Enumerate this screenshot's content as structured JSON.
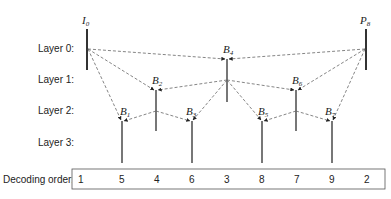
{
  "layers": [
    {
      "label": "Layer 0:",
      "y": 49
    },
    {
      "label": "Layer 1:",
      "y": 80
    },
    {
      "label": "Layer 2:",
      "y": 111
    },
    {
      "label": "Layer 3:",
      "y": 143
    }
  ],
  "frames": [
    {
      "id": "I0",
      "base": "I",
      "sub": "0",
      "x": 87,
      "layer": 0,
      "type": "reference"
    },
    {
      "id": "B1",
      "base": "B",
      "sub": "1",
      "x": 122,
      "layer": 2
    },
    {
      "id": "B2",
      "base": "B",
      "sub": "2",
      "x": 156,
      "layer": 1
    },
    {
      "id": "B3",
      "base": "B",
      "sub": "3",
      "x": 192,
      "layer": 2
    },
    {
      "id": "B4",
      "base": "B",
      "sub": "4",
      "x": 227,
      "layer": 0
    },
    {
      "id": "B5",
      "base": "B",
      "sub": "5",
      "x": 262,
      "layer": 2
    },
    {
      "id": "B6",
      "base": "B",
      "sub": "6",
      "x": 296,
      "layer": 1
    },
    {
      "id": "B7",
      "base": "B",
      "sub": "7",
      "x": 332,
      "layer": 2
    },
    {
      "id": "P8",
      "base": "P",
      "sub": "8",
      "x": 366,
      "layer": 0,
      "type": "reference"
    }
  ],
  "references": [
    {
      "to": "B4",
      "from": [
        "I0",
        "P8"
      ]
    },
    {
      "to": "B2",
      "from": [
        "I0",
        "B4"
      ]
    },
    {
      "to": "B6",
      "from": [
        "B4",
        "P8"
      ]
    },
    {
      "to": "B1",
      "from": [
        "I0",
        "B2"
      ]
    },
    {
      "to": "B3",
      "from": [
        "B2",
        "B4"
      ]
    },
    {
      "to": "B5",
      "from": [
        "B4",
        "B6"
      ]
    },
    {
      "to": "B7",
      "from": [
        "B6",
        "P8"
      ]
    }
  ],
  "decoding": {
    "label": "Decoding order:",
    "values": [
      "1",
      "5",
      "4",
      "6",
      "3",
      "8",
      "7",
      "9",
      "2"
    ]
  }
}
